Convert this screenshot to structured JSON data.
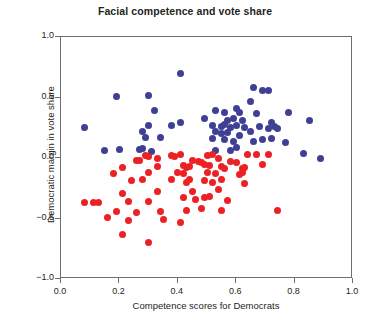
{
  "chart_data": {
    "type": "scatter",
    "title": "Facial competence and vote share",
    "xlabel": "Competence scores for Democrats",
    "ylabel": "Democratic margin in vote share",
    "xlim": [
      0.0,
      1.0
    ],
    "ylim": [
      -1.0,
      1.0
    ],
    "xticks": [
      "0.0",
      "0.2",
      "0.4",
      "0.6",
      "0.8",
      "1.0"
    ],
    "xtick_values": [
      0.0,
      0.2,
      0.4,
      0.6,
      0.8,
      1.0
    ],
    "yticks": [
      "1.0",
      "0.5",
      "0.0",
      "-0.5",
      "-1.0"
    ],
    "ytick_values": [
      1.0,
      0.5,
      0.0,
      -0.5,
      -1.0
    ],
    "grid": false,
    "legend": "none",
    "colors": {
      "democrat_win": "#3f3f96",
      "democrat_loss": "#ed2024",
      "frame": "#6d6e71",
      "text": "#231f20",
      "background": "#ffffff"
    },
    "series": [
      {
        "name": "Positive Democratic margin",
        "color": "#3f3f96",
        "marker": "circle",
        "points": [
          [
            0.41,
            0.7
          ],
          [
            0.3,
            0.52
          ],
          [
            0.19,
            0.51
          ],
          [
            0.66,
            0.58
          ],
          [
            0.69,
            0.56
          ],
          [
            0.71,
            0.56
          ],
          [
            0.65,
            0.47
          ],
          [
            0.32,
            0.39
          ],
          [
            0.53,
            0.39
          ],
          [
            0.56,
            0.38
          ],
          [
            0.6,
            0.41
          ],
          [
            0.61,
            0.38
          ],
          [
            0.67,
            0.37
          ],
          [
            0.78,
            0.38
          ],
          [
            0.59,
            0.33
          ],
          [
            0.49,
            0.33
          ],
          [
            0.57,
            0.31
          ],
          [
            0.62,
            0.31
          ],
          [
            0.72,
            0.29
          ],
          [
            0.85,
            0.31
          ],
          [
            0.3,
            0.27
          ],
          [
            0.38,
            0.27
          ],
          [
            0.41,
            0.29
          ],
          [
            0.52,
            0.27
          ],
          [
            0.55,
            0.26
          ],
          [
            0.56,
            0.28
          ],
          [
            0.58,
            0.25
          ],
          [
            0.6,
            0.27
          ],
          [
            0.63,
            0.25
          ],
          [
            0.68,
            0.26
          ],
          [
            0.71,
            0.24
          ],
          [
            0.73,
            0.26
          ],
          [
            0.74,
            0.24
          ],
          [
            0.08,
            0.25
          ],
          [
            0.28,
            0.22
          ],
          [
            0.53,
            0.22
          ],
          [
            0.55,
            0.2
          ],
          [
            0.57,
            0.21
          ],
          [
            0.61,
            0.19
          ],
          [
            0.65,
            0.22
          ],
          [
            0.29,
            0.17
          ],
          [
            0.34,
            0.17
          ],
          [
            0.52,
            0.16
          ],
          [
            0.56,
            0.15
          ],
          [
            0.59,
            0.14
          ],
          [
            0.66,
            0.14
          ],
          [
            0.69,
            0.15
          ],
          [
            0.72,
            0.16
          ],
          [
            0.77,
            0.13
          ],
          [
            0.15,
            0.06
          ],
          [
            0.2,
            0.07
          ],
          [
            0.27,
            0.07
          ],
          [
            0.28,
            0.08
          ],
          [
            0.31,
            0.05
          ],
          [
            0.53,
            0.06
          ],
          [
            0.58,
            0.06
          ],
          [
            0.6,
            0.09
          ],
          [
            0.83,
            0.04
          ],
          [
            0.89,
            0.0
          ]
        ]
      },
      {
        "name": "Negative Democratic margin",
        "color": "#ed2024",
        "marker": "circle",
        "points": [
          [
            0.29,
            0.02
          ],
          [
            0.3,
            0.01
          ],
          [
            0.33,
            0.0
          ],
          [
            0.38,
            0.02
          ],
          [
            0.39,
            0.01
          ],
          [
            0.41,
            0.03
          ],
          [
            0.5,
            0.02
          ],
          [
            0.52,
            0.03
          ],
          [
            0.54,
            0.0
          ],
          [
            0.64,
            0.03
          ],
          [
            0.67,
            0.03
          ],
          [
            0.71,
            0.03
          ],
          [
            0.26,
            -0.02
          ],
          [
            0.27,
            -0.02
          ],
          [
            0.45,
            -0.02
          ],
          [
            0.47,
            -0.03
          ],
          [
            0.48,
            -0.04
          ],
          [
            0.49,
            -0.05
          ],
          [
            0.58,
            -0.03
          ],
          [
            0.6,
            -0.04
          ],
          [
            0.69,
            -0.05
          ],
          [
            0.21,
            -0.08
          ],
          [
            0.33,
            -0.07
          ],
          [
            0.42,
            -0.06
          ],
          [
            0.43,
            -0.08
          ],
          [
            0.44,
            -0.07
          ],
          [
            0.51,
            -0.06
          ],
          [
            0.55,
            -0.07
          ],
          [
            0.56,
            -0.09
          ],
          [
            0.62,
            -0.09
          ],
          [
            0.63,
            -0.08
          ],
          [
            0.18,
            -0.13
          ],
          [
            0.3,
            -0.12
          ],
          [
            0.4,
            -0.12
          ],
          [
            0.42,
            -0.13
          ],
          [
            0.5,
            -0.12
          ],
          [
            0.53,
            -0.13
          ],
          [
            0.61,
            -0.14
          ],
          [
            0.62,
            -0.12
          ],
          [
            0.24,
            -0.19
          ],
          [
            0.28,
            -0.18
          ],
          [
            0.38,
            -0.18
          ],
          [
            0.43,
            -0.2
          ],
          [
            0.44,
            -0.18
          ],
          [
            0.49,
            -0.19
          ],
          [
            0.52,
            -0.2
          ],
          [
            0.55,
            -0.18
          ],
          [
            0.63,
            -0.21
          ],
          [
            0.08,
            -0.37
          ],
          [
            0.11,
            -0.37
          ],
          [
            0.13,
            -0.37
          ],
          [
            0.23,
            -0.36
          ],
          [
            0.3,
            -0.36
          ],
          [
            0.42,
            -0.33
          ],
          [
            0.46,
            -0.34
          ],
          [
            0.49,
            -0.33
          ],
          [
            0.51,
            -0.32
          ],
          [
            0.57,
            -0.35
          ],
          [
            0.21,
            -0.29
          ],
          [
            0.33,
            -0.28
          ],
          [
            0.45,
            -0.28
          ],
          [
            0.54,
            -0.26
          ],
          [
            0.19,
            -0.44
          ],
          [
            0.26,
            -0.45
          ],
          [
            0.34,
            -0.44
          ],
          [
            0.43,
            -0.43
          ],
          [
            0.48,
            -0.42
          ],
          [
            0.55,
            -0.43
          ],
          [
            0.16,
            -0.49
          ],
          [
            0.23,
            -0.52
          ],
          [
            0.35,
            -0.51
          ],
          [
            0.41,
            -0.53
          ],
          [
            0.74,
            -0.43
          ],
          [
            0.21,
            -0.63
          ],
          [
            0.3,
            -0.7
          ]
        ]
      }
    ]
  }
}
